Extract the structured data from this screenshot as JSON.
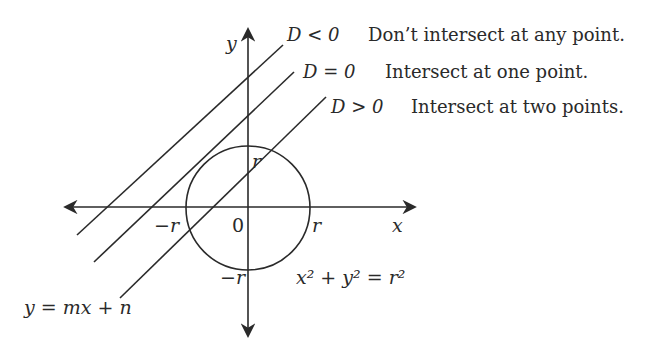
{
  "diagram": {
    "axes": {
      "x_label": "x",
      "y_label": "y",
      "origin_label": "0"
    },
    "circle": {
      "equation": "x² + y² = r²",
      "ticks": {
        "pos_x": "r",
        "neg_x": "−r",
        "pos_y": "r",
        "neg_y": "−r"
      }
    },
    "line_equation": "y = mx + n",
    "cases": [
      {
        "condition": "D < 0",
        "description": "Don’t intersect at any point."
      },
      {
        "condition": "D = 0",
        "description": "Intersect at one point."
      },
      {
        "condition": "D > 0",
        "description": "Intersect at two points."
      }
    ],
    "color": "#2a2a2a"
  }
}
